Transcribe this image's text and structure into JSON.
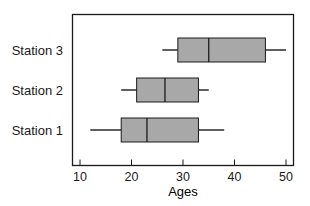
{
  "chart_data": {
    "type": "boxplot",
    "title": "",
    "xlabel": "Ages",
    "ylabel": "",
    "xlim": [
      8.5,
      51.5
    ],
    "xticks": [
      10,
      20,
      30,
      40,
      50
    ],
    "grid": false,
    "legend": null,
    "orientation": "horizontal",
    "categories": [
      "Station 1",
      "Station 2",
      "Station 3"
    ],
    "series": [
      {
        "name": "Station 1",
        "min": 12,
        "q1": 18,
        "median": 23,
        "q3": 33,
        "max": 38
      },
      {
        "name": "Station 2",
        "min": 18,
        "q1": 21,
        "median": 26.5,
        "q3": 33,
        "max": 35
      },
      {
        "name": "Station 3",
        "min": 26,
        "q1": 29,
        "median": 35,
        "q3": 46,
        "max": 50
      }
    ]
  },
  "colors": {
    "box_fill": "#a8a8a8",
    "stroke": "#1a1a1a"
  }
}
